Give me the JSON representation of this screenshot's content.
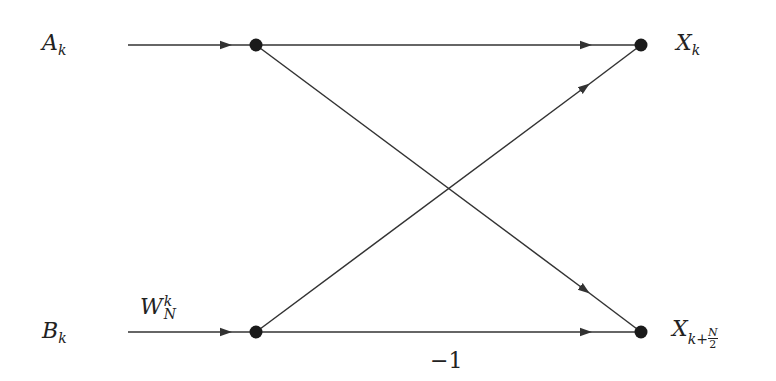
{
  "diagram": {
    "type": "butterfly",
    "colors": {
      "line": "#333333",
      "node": "#1a1a1a",
      "background": "#ffffff"
    },
    "inputs": [
      {
        "symbol": "A",
        "subscript": "k"
      },
      {
        "symbol": "B",
        "subscript": "k"
      }
    ],
    "outputs": [
      {
        "symbol": "X",
        "subscript": "k"
      },
      {
        "symbol": "X",
        "subscript": "k+",
        "frac_num": "N",
        "frac_den": "2"
      }
    ],
    "twiddle": {
      "symbol": "W",
      "superscript": "k",
      "subscript": "N"
    },
    "multiplier": "−1",
    "edges": [
      {
        "from": "A_k",
        "to": "X_k"
      },
      {
        "from": "A_k",
        "to": "X_{k+N/2}"
      },
      {
        "from": "B_k",
        "to": "X_k"
      },
      {
        "from": "B_k",
        "to": "X_{k+N/2}",
        "weight": "−1"
      }
    ]
  }
}
